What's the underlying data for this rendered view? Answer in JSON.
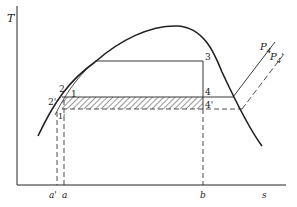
{
  "diagram": {
    "type": "T-s diagram",
    "axes": {
      "y_label": "T",
      "x_label": "s"
    },
    "x_ticks": [
      "a'",
      "a",
      "b"
    ],
    "points": [
      {
        "id": "1",
        "label": "1"
      },
      {
        "id": "2",
        "label": "2"
      },
      {
        "id": "2p",
        "label": "2'"
      },
      {
        "id": "1p",
        "label": "1'"
      },
      {
        "id": "3",
        "label": "3"
      },
      {
        "id": "4",
        "label": "4"
      },
      {
        "id": "4p",
        "label": "4'"
      }
    ],
    "isobars": [
      {
        "id": "P4",
        "label": "P",
        "subscript": "4",
        "prime": ""
      },
      {
        "id": "P4p",
        "label": "P",
        "subscript": "4",
        "prime": "'"
      }
    ],
    "colors": {
      "line": "#222222",
      "background": "#ffffff"
    }
  }
}
